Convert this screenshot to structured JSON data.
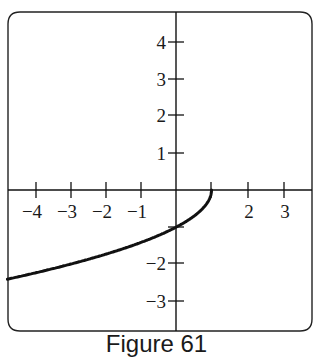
{
  "figure": {
    "caption": "Figure 61"
  },
  "chart_data": {
    "type": "line",
    "title": "",
    "caption": "Figure 61",
    "xlabel": "",
    "ylabel": "",
    "xlim": [
      -4.7,
      3.7
    ],
    "ylim": [
      -3.8,
      4.7
    ],
    "grid": false,
    "legend": null,
    "x_ticks": [
      -4,
      -3,
      -2,
      -1,
      1,
      2,
      3
    ],
    "x_tick_labels": [
      "−4",
      "−3",
      "−2",
      "−1",
      "2",
      "3"
    ],
    "y_ticks": [
      4,
      3,
      2,
      1,
      -1,
      -2,
      -3
    ],
    "y_tick_labels": [
      "4",
      "3",
      "2",
      "1",
      "−2",
      "−3"
    ],
    "series": [
      {
        "name": "curve",
        "description": "y = -sqrt(1 - x), endpoint at (1, 0)",
        "x": [
          -4.7,
          -4,
          -3,
          -2,
          -1,
          0,
          0.5,
          0.75,
          0.9,
          1
        ],
        "y": [
          -2.39,
          -2.24,
          -2.0,
          -1.73,
          -1.41,
          -1.0,
          -0.71,
          -0.5,
          -0.32,
          0
        ]
      }
    ],
    "color": "#111111"
  }
}
